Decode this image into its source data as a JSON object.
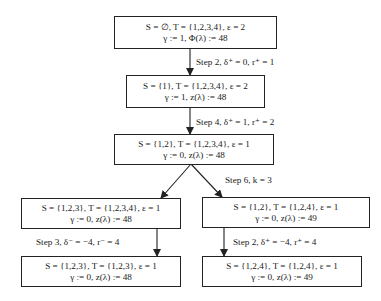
{
  "diagram": {
    "type": "search-tree",
    "nodes": [
      {
        "id": "n1",
        "line1": "S = ∅, T = {1,2,3,4}, ε = 2",
        "line2": "γ := 1, Φ(λ) := 48"
      },
      {
        "id": "n2",
        "line1": "S = {1}, T = {1,2,3,4}, ε = 2",
        "line2": "γ := 1, z(λ) := 48"
      },
      {
        "id": "n3",
        "line1": "S = {1,2}, T = {1,2,3,4}, ε = 1",
        "line2": "γ := 0, z(λ) := 48"
      },
      {
        "id": "n4",
        "line1": "S = {1,2,3}, T = {1,2,3,4}, ε = 1",
        "line2": "γ := 0, z(λ) := 48"
      },
      {
        "id": "n5",
        "line1": "S = {1,2}, T = {1,2,4}, ε = 1",
        "line2": "γ := 0, z(λ) := 49"
      },
      {
        "id": "n6",
        "line1": "S = {1,2,3}, T = {1,2,3}, ε = 1",
        "line2": "γ := 0, z(λ) := 48"
      },
      {
        "id": "n7",
        "line1": "S = {1,2,4}, T = {1,2,4}, ε = 1",
        "line2": "γ := 0, z(λ) := 49"
      }
    ],
    "edges": [
      {
        "from": "n1",
        "to": "n2",
        "label": "Step 2, δ⁺ = 0, r⁺ = 1"
      },
      {
        "from": "n2",
        "to": "n3",
        "label": "Step 4, δ⁺ = 1, r⁺ = 2"
      },
      {
        "from": "n3",
        "to": "n4",
        "label": ""
      },
      {
        "from": "n3",
        "to": "n5",
        "label": "Step 6, k = 3"
      },
      {
        "from": "n4",
        "to": "n6",
        "label": "Step 3, δ⁻ = −4, r⁻ = 4"
      },
      {
        "from": "n5",
        "to": "n7",
        "label": "Step 2, δ⁺ = −4, r⁺ = 4"
      }
    ],
    "colors": {
      "line": "#222222",
      "background": "#ffffff",
      "text": "#1a1a1a"
    }
  }
}
